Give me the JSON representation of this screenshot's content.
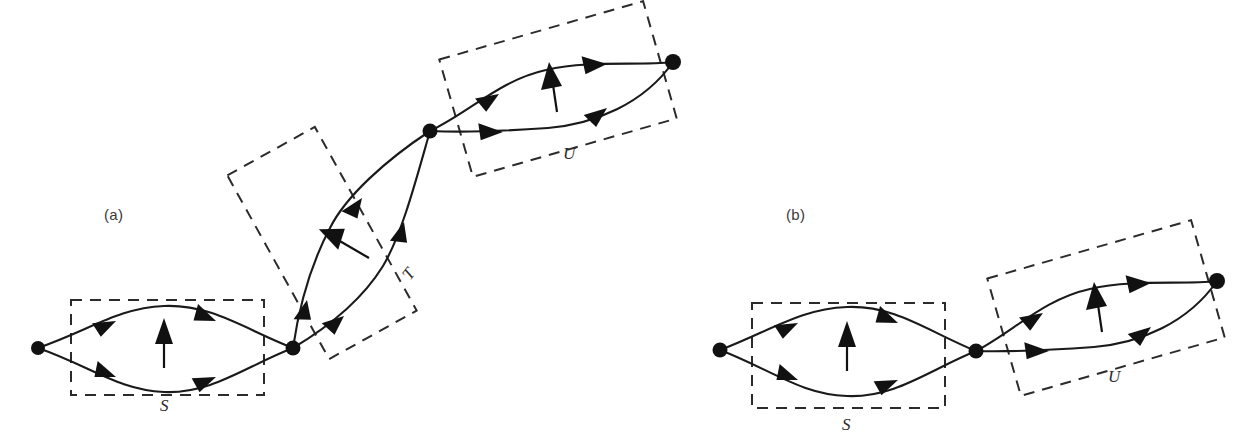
{
  "figure": {
    "background_color": "#ffffff",
    "ink_color": "#111111",
    "dash_color": "#2b2b2b",
    "panels": [
      {
        "id": "a",
        "label": "(a)",
        "label_pos": {
          "x": 104,
          "y": 220
        },
        "description": "Series-parallel digraph with three two-terminal blocks S, T, U chained from lower-left to upper-right",
        "nodes": [
          {
            "name": "node-a-1",
            "x": 38,
            "y": 348,
            "r": 7
          },
          {
            "name": "node-a-2",
            "x": 293,
            "y": 348,
            "r": 7.5
          },
          {
            "name": "node-a-3",
            "x": 430,
            "y": 131,
            "r": 7.5
          },
          {
            "name": "node-a-4",
            "x": 673,
            "y": 62,
            "r": 8
          }
        ],
        "blocks": [
          {
            "name": "block-S",
            "label": "S",
            "label_pos": {
              "x": 160,
              "y": 411
            },
            "rotation_deg": 0,
            "rect": {
              "x": 71,
              "y": 300,
              "w": 193,
              "h": 95
            },
            "normal_arrow": {
              "x1": 164,
              "y1": 367,
              "x2": 164,
              "y2": 322
            }
          },
          {
            "name": "block-T",
            "label": "T",
            "label_pos": {
              "x": 410,
              "y": 281
            },
            "rotation_deg": -60,
            "rect": {
              "x": 272,
              "y": 138,
              "w": 100,
              "h": 210
            },
            "normal_arrow": {
              "x1": 361,
              "y1": 254,
              "x2": 324,
              "y2": 232
            }
          },
          {
            "name": "block-U",
            "label": "U",
            "label_pos": {
              "x": 563,
              "y": 159
            },
            "rotation_deg": -16,
            "rect": {
              "x": 452,
              "y": 28,
              "w": 212,
              "h": 122
            },
            "normal_arrow": {
              "x1": 552,
              "y1": 110,
              "x2": 552,
              "y2": 67
            }
          }
        ],
        "edges": [
          {
            "name": "edge-a-S-upper",
            "from": "node-a-1",
            "to": "node-a-2",
            "arrow_count": 2
          },
          {
            "name": "edge-a-S-lower",
            "from": "node-a-1",
            "to": "node-a-2",
            "arrow_count": 2
          },
          {
            "name": "edge-a-T-upper",
            "from": "node-a-2",
            "to": "node-a-3",
            "arrow_count": 2
          },
          {
            "name": "edge-a-T-lower",
            "from": "node-a-2",
            "to": "node-a-3",
            "arrow_count": 2
          },
          {
            "name": "edge-a-U-upper",
            "from": "node-a-3",
            "to": "node-a-4",
            "arrow_count": 2
          },
          {
            "name": "edge-a-U-lower",
            "from": "node-a-3",
            "to": "node-a-4",
            "arrow_count": 2
          }
        ]
      },
      {
        "id": "b",
        "label": "(b)",
        "label_pos": {
          "x": 786,
          "y": 220
        },
        "description": "Series-parallel digraph with two two-terminal blocks S and U chained left to right",
        "nodes": [
          {
            "name": "node-b-1",
            "x": 720,
            "y": 350,
            "r": 7.5
          },
          {
            "name": "node-b-2",
            "x": 976,
            "y": 351,
            "r": 7.5
          },
          {
            "name": "node-b-3",
            "x": 1217,
            "y": 281,
            "r": 8
          }
        ],
        "blocks": [
          {
            "name": "block-S",
            "label": "S",
            "label_pos": {
              "x": 842,
              "y": 430
            },
            "rotation_deg": 0,
            "rect": {
              "x": 752,
              "y": 303,
              "w": 193,
              "h": 105
            },
            "normal_arrow": {
              "x1": 847,
              "y1": 370,
              "x2": 847,
              "y2": 325
            }
          },
          {
            "name": "block-U",
            "label": "U",
            "label_pos": {
              "x": 1108,
              "y": 382
            },
            "rotation_deg": -16,
            "rect": {
              "x": 1000,
              "y": 247,
              "w": 212,
              "h": 122
            },
            "normal_arrow": {
              "x1": 1097,
              "y1": 330,
              "x2": 1097,
              "y2": 287
            }
          }
        ],
        "edges": [
          {
            "name": "edge-b-S-upper",
            "from": "node-b-1",
            "to": "node-b-2",
            "arrow_count": 2
          },
          {
            "name": "edge-b-S-lower",
            "from": "node-b-1",
            "to": "node-b-2",
            "arrow_count": 2
          },
          {
            "name": "edge-b-U-upper",
            "from": "node-b-2",
            "to": "node-b-3",
            "arrow_count": 2
          },
          {
            "name": "edge-b-U-lower",
            "from": "node-b-2",
            "to": "node-b-3",
            "arrow_count": 2
          }
        ]
      }
    ]
  }
}
